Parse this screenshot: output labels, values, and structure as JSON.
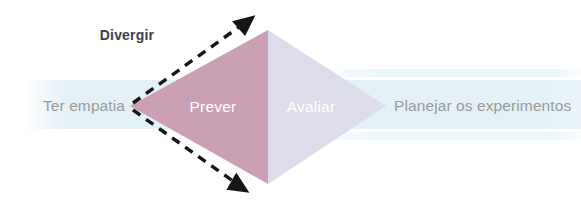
{
  "diagram": {
    "title_label": "Divergir",
    "stages": [
      {
        "id": "ter-empatia",
        "label": "Ter empatia",
        "position": "left-outside",
        "text_color": "#9a9a9a"
      },
      {
        "id": "prever",
        "label": "Prever",
        "position": "left-inside",
        "text_color": "#ffffff"
      },
      {
        "id": "avaliar",
        "label": "Avaliar",
        "position": "right-inside",
        "text_color": "#ffffff"
      },
      {
        "id": "planejar-os-experimentos",
        "label": "Planejar os experimentos",
        "position": "right-outside",
        "text_color": "#9a9a9a"
      }
    ],
    "shapes": {
      "left_triangle_fill": "#cb9fb4",
      "right_triangle_fill": "#dcdcea",
      "band_fill": "#e3f1f6",
      "stripe_fill": "#eaf6fa",
      "arrow_color": "#1a1a1a",
      "background": "#ffffff"
    },
    "geometry": {
      "diamond_left_x": 130,
      "diamond_right_x": 386,
      "diamond_top_y": 30,
      "diamond_bottom_y": 184,
      "diamond_center_x": 268,
      "diamond_center_y": 106,
      "band_top_y": 80,
      "band_bottom_y": 129,
      "band_left_x": 28,
      "band_right_x": 581
    },
    "annotations": {
      "divergence_arrow_top": "arrow pointing up-right",
      "divergence_arrow_bottom": "arrow pointing down-right"
    }
  }
}
